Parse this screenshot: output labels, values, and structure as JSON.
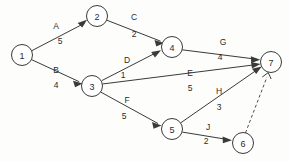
{
  "diagram": {
    "type": "directed-weighted-network",
    "title": "",
    "canvas": {
      "width": 289,
      "height": 162,
      "background": "#fdfdfb"
    },
    "style": {
      "line_color": "#3a3a3a",
      "node_fill": "#ffffff",
      "node_stroke": "#3a3a3a",
      "text_color": "#2b2b2b",
      "node_radius": 10.5
    },
    "nodes": [
      {
        "id": "1",
        "label": "1",
        "x": 22,
        "y": 55
      },
      {
        "id": "2",
        "label": "2",
        "x": 97,
        "y": 16
      },
      {
        "id": "3",
        "label": "3",
        "x": 92,
        "y": 86
      },
      {
        "id": "4",
        "label": "4",
        "x": 172,
        "y": 47
      },
      {
        "id": "5",
        "label": "5",
        "x": 172,
        "y": 129
      },
      {
        "id": "6",
        "label": "6",
        "x": 243,
        "y": 143
      },
      {
        "id": "7",
        "label": "7",
        "x": 271,
        "y": 62
      }
    ],
    "edges": [
      {
        "id": "A",
        "name": "A",
        "weight": "5",
        "from": "1",
        "to": "2",
        "arrow": "solid",
        "dashed": false,
        "name_x": 56,
        "name_y": 26,
        "weight_x": 60,
        "weight_y": 41
      },
      {
        "id": "B",
        "name": "B",
        "weight": "4",
        "from": "1",
        "to": "3",
        "arrow": "solid",
        "dashed": false,
        "name_x": 56,
        "name_y": 70,
        "weight_x": 56,
        "weight_y": 85
      },
      {
        "id": "C",
        "name": "C",
        "weight": "2",
        "from": "2",
        "to": "4",
        "arrow": "solid",
        "dashed": false,
        "name_x": 134,
        "name_y": 17,
        "weight_x": 134,
        "weight_y": 34
      },
      {
        "id": "D",
        "name": "D",
        "weight": "1",
        "from": "3",
        "to": "4",
        "arrow": "solid",
        "dashed": false,
        "name_x": 127,
        "name_y": 60,
        "weight_x": 123,
        "weight_y": 75
      },
      {
        "id": "E",
        "name": "E",
        "weight": "5",
        "from": "3",
        "to": "7",
        "arrow": "solid",
        "dashed": false,
        "name_x": 190,
        "name_y": 73,
        "weight_x": 190,
        "weight_y": 88
      },
      {
        "id": "F",
        "name": "F",
        "weight": "5",
        "from": "3",
        "to": "5",
        "arrow": "solid",
        "dashed": false,
        "name_x": 127,
        "name_y": 100,
        "weight_x": 124,
        "weight_y": 116
      },
      {
        "id": "G",
        "name": "G",
        "weight": "4",
        "from": "4",
        "to": "7",
        "arrow": "solid",
        "dashed": false,
        "name_x": 223,
        "name_y": 42,
        "weight_x": 220,
        "weight_y": 57
      },
      {
        "id": "H",
        "name": "H",
        "weight": "3",
        "from": "5",
        "to": "7",
        "arrow": "solid",
        "dashed": false,
        "name_x": 219,
        "name_y": 91,
        "weight_x": 219,
        "weight_y": 107
      },
      {
        "id": "J",
        "name": "J",
        "weight": "2",
        "from": "5",
        "to": "6",
        "arrow": "solid",
        "dashed": false,
        "name_x": 208,
        "name_y": 127,
        "weight_x": 206,
        "weight_y": 141
      },
      {
        "id": "K",
        "name": "",
        "weight": "",
        "from": "6",
        "to": "7",
        "arrow": "open",
        "dashed": true,
        "name_x": 0,
        "name_y": 0,
        "weight_x": 0,
        "weight_y": 0
      }
    ]
  }
}
